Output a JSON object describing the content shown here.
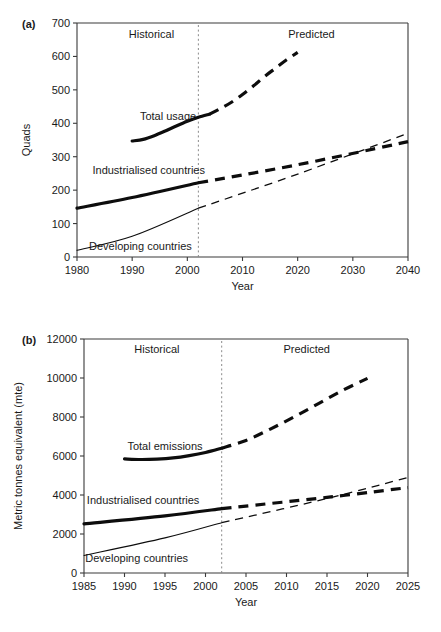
{
  "figure": {
    "background": "#ffffff",
    "ink": "#0d0d0d",
    "axis_color": "#3a3a3a",
    "divider_color": "#8a8a8a"
  },
  "panel_a": {
    "tag": "(a)",
    "region_historical": "Historical",
    "region_predicted": "Predicted",
    "label_total": "Total usage",
    "label_industrialised": "Industrialised countries",
    "label_developing": "Developing countries"
  },
  "panel_b": {
    "tag": "(b)",
    "region_historical": "Historical",
    "region_predicted": "Predicted",
    "label_total": "Total emissions",
    "label_industrialised": "Industrialised countries",
    "label_developing": "Developing countries"
  },
  "chart_data": [
    {
      "id": "panel-a",
      "type": "line",
      "title": "",
      "panel_tag": "(a)",
      "xlabel": "Year",
      "ylabel": "Quads",
      "xlim": [
        1980,
        2040
      ],
      "ylim": [
        0,
        700
      ],
      "xticks": [
        1980,
        1990,
        2000,
        2010,
        2020,
        2030,
        2040
      ],
      "yticks": [
        0,
        100,
        200,
        300,
        400,
        500,
        600,
        700
      ],
      "xtick_labels": [
        "1980",
        "1990",
        "2000",
        "2010",
        "2020",
        "2030",
        "2040"
      ],
      "ytick_labels": [
        "0",
        "100",
        "200",
        "300",
        "400",
        "500",
        "600",
        "700"
      ],
      "grid": false,
      "legend_position": "inline-annotations",
      "divider_x": 2002,
      "annotations": [
        {
          "text": "Historical",
          "x": 1993.5,
          "y": 655
        },
        {
          "text": "Predicted",
          "x": 2022.5,
          "y": 655
        },
        {
          "text": "Total usage",
          "x": 1996.5,
          "y": 410
        },
        {
          "text": "Industrialised countries",
          "x": 1993.0,
          "y": 248
        },
        {
          "text": "Developing countries",
          "x": 1991.5,
          "y": 22
        }
      ],
      "series": [
        {
          "name": "Total usage",
          "style": "thick-solid",
          "segment": "historical",
          "x": [
            1990,
            1992,
            1994,
            1996,
            1998,
            2000,
            2002,
            2004
          ],
          "values": [
            347,
            352,
            363,
            377,
            392,
            406,
            418,
            427
          ]
        },
        {
          "name": "Total usage",
          "style": "thick-dashed",
          "segment": "predicted",
          "x": [
            2004,
            2006,
            2008,
            2010,
            2012,
            2014,
            2016,
            2018,
            2020
          ],
          "values": [
            427,
            444,
            463,
            486,
            512,
            540,
            565,
            590,
            612
          ]
        },
        {
          "name": "Industrialised countries",
          "style": "thick-solid",
          "segment": "historical",
          "x": [
            1980,
            1990,
            2002
          ],
          "values": [
            146,
            178,
            222
          ]
        },
        {
          "name": "Industrialised countries",
          "style": "thick-dashed",
          "segment": "predicted",
          "x": [
            2002,
            2020,
            2040
          ],
          "values": [
            222,
            276,
            345
          ]
        },
        {
          "name": "Developing countries",
          "style": "thin-solid",
          "segment": "historical",
          "x": [
            1980,
            1990,
            2002
          ],
          "values": [
            20,
            62,
            146
          ]
        },
        {
          "name": "Developing countries",
          "style": "thin-dashed",
          "segment": "predicted",
          "x": [
            2002,
            2020,
            2040
          ],
          "values": [
            146,
            248,
            370
          ]
        }
      ]
    },
    {
      "id": "panel-b",
      "type": "line",
      "title": "",
      "panel_tag": "(b)",
      "xlabel": "Year",
      "ylabel": "Metric tonnes equivalent (mte)",
      "xlim": [
        1985,
        2025
      ],
      "ylim": [
        0,
        12000
      ],
      "xticks": [
        1985,
        1990,
        1995,
        2000,
        2005,
        2010,
        2015,
        2020,
        2025
      ],
      "yticks": [
        0,
        2000,
        4000,
        6000,
        8000,
        10000,
        12000
      ],
      "xtick_labels": [
        "1985",
        "1990",
        "1995",
        "2000",
        "2005",
        "2010",
        "2015",
        "2020",
        "2025"
      ],
      "ytick_labels": [
        "0",
        "2000",
        "4000",
        "6000",
        "8000",
        "10000",
        "12000"
      ],
      "grid": false,
      "legend_position": "inline-annotations",
      "divider_x": 2002,
      "annotations": [
        {
          "text": "Historical",
          "x": 1994.0,
          "y": 11300
        },
        {
          "text": "Predicted",
          "x": 2012.5,
          "y": 11300
        },
        {
          "text": "Total emissions",
          "x": 1995.0,
          "y": 6330
        },
        {
          "text": "Industrialised countries",
          "x": 1992.3,
          "y": 3560
        },
        {
          "text": "Developing countries",
          "x": 1991.5,
          "y": 570
        }
      ],
      "series": [
        {
          "name": "Total emissions",
          "style": "thick-solid",
          "segment": "historical",
          "x": [
            1990,
            1992,
            1994,
            1996,
            1998,
            2000,
            2002
          ],
          "values": [
            5850,
            5820,
            5840,
            5900,
            6020,
            6180,
            6400
          ]
        },
        {
          "name": "Total emissions",
          "style": "thick-dashed",
          "segment": "predicted",
          "x": [
            2002,
            2005,
            2008,
            2011,
            2014,
            2017,
            2020
          ],
          "values": [
            6400,
            6800,
            7380,
            8020,
            8700,
            9380,
            9980
          ]
        },
        {
          "name": "Industrialised countries",
          "style": "thick-solid",
          "segment": "historical",
          "x": [
            1985,
            1995,
            2002
          ],
          "values": [
            2520,
            2930,
            3300
          ]
        },
        {
          "name": "Industrialised countries",
          "style": "thick-dashed",
          "segment": "predicted",
          "x": [
            2002,
            2015,
            2025
          ],
          "values": [
            3300,
            3880,
            4380
          ]
        },
        {
          "name": "Developing countries",
          "style": "thin-solid",
          "segment": "historical",
          "x": [
            1985,
            1995,
            2002
          ],
          "values": [
            900,
            1800,
            2580
          ]
        },
        {
          "name": "Developing countries",
          "style": "thin-dashed",
          "segment": "predicted",
          "x": [
            2002,
            2015,
            2025
          ],
          "values": [
            2580,
            3820,
            4900
          ]
        }
      ]
    }
  ]
}
